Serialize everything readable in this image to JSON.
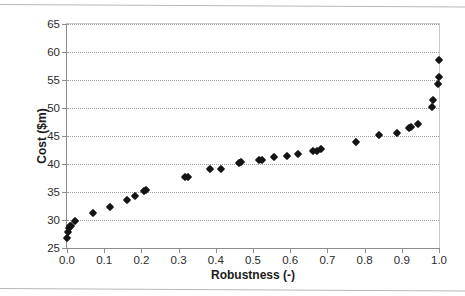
{
  "chart_data": {
    "type": "scatter",
    "title": "",
    "xlabel": "Robustness (-)",
    "ylabel": "Cost ($m)",
    "xlim": [
      0.0,
      1.0
    ],
    "ylim": [
      25,
      65
    ],
    "xticks": [
      "0.0",
      "0.1",
      "0.2",
      "0.3",
      "0.4",
      "0.5",
      "0.6",
      "0.7",
      "0.8",
      "0.9",
      "1.0"
    ],
    "xtick_values": [
      0.0,
      0.1,
      0.2,
      0.3,
      0.4,
      0.5,
      0.6,
      0.7,
      0.8,
      0.9,
      1.0
    ],
    "yticks": [
      "25",
      "30",
      "35",
      "40",
      "45",
      "50",
      "55",
      "60",
      "65"
    ],
    "ytick_values": [
      25,
      30,
      35,
      40,
      45,
      50,
      55,
      60,
      65
    ],
    "grid": "horizontal-dotted",
    "legend": "none",
    "marker": "diamond",
    "marker_color": "#141414",
    "series": [
      {
        "name": "Cost vs Robustness",
        "points": [
          [
            0.0,
            26.8
          ],
          [
            0.003,
            27.9
          ],
          [
            0.005,
            28.5
          ],
          [
            0.008,
            28.9
          ],
          [
            0.012,
            29.0
          ],
          [
            0.022,
            29.9
          ],
          [
            0.07,
            31.3
          ],
          [
            0.115,
            32.3
          ],
          [
            0.162,
            33.5
          ],
          [
            0.183,
            34.2
          ],
          [
            0.208,
            35.2
          ],
          [
            0.213,
            35.3
          ],
          [
            0.318,
            37.6
          ],
          [
            0.325,
            37.7
          ],
          [
            0.385,
            39.1
          ],
          [
            0.415,
            39.1
          ],
          [
            0.462,
            40.2
          ],
          [
            0.468,
            40.3
          ],
          [
            0.515,
            40.7
          ],
          [
            0.523,
            40.8
          ],
          [
            0.557,
            41.2
          ],
          [
            0.592,
            41.5
          ],
          [
            0.622,
            41.8
          ],
          [
            0.662,
            42.3
          ],
          [
            0.672,
            42.4
          ],
          [
            0.682,
            42.7
          ],
          [
            0.778,
            43.9
          ],
          [
            0.84,
            45.1
          ],
          [
            0.888,
            45.6
          ],
          [
            0.92,
            46.5
          ],
          [
            0.925,
            46.6
          ],
          [
            0.943,
            47.2
          ],
          [
            0.98,
            50.2
          ],
          [
            0.984,
            51.5
          ],
          [
            0.998,
            54.3
          ],
          [
            1.0,
            55.6
          ],
          [
            1.0,
            58.5
          ]
        ]
      }
    ]
  }
}
